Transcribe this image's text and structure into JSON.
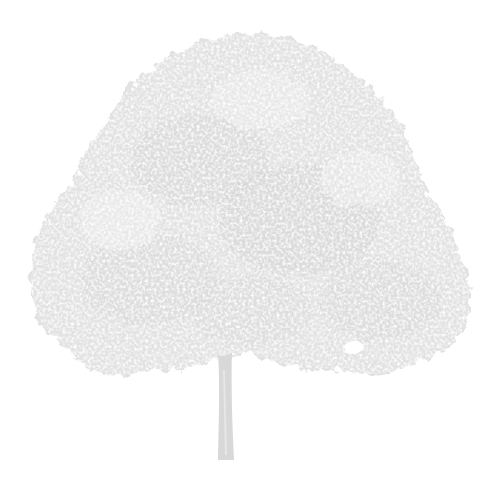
{
  "image": {
    "subject": "tree",
    "description": "Pale gray silhouette of a broad deciduous tree with a dense rounded canopy and a single straight trunk on a white background",
    "colors": {
      "background": "#ffffff",
      "foliage": "#e2e2e2",
      "foliage_dark": "#d4d4d4",
      "foliage_light": "#eeeeee",
      "trunk": "#d8d8d8"
    }
  }
}
